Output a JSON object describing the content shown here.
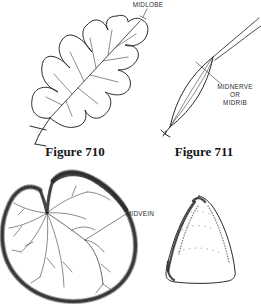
{
  "colors": {
    "ink": "#2b2b2b"
  },
  "figures": {
    "fig710": {
      "caption": "Figure 710",
      "annotation": "MIDLOBE"
    },
    "fig711": {
      "caption": "Figure 711",
      "annotation_lines": [
        "MIDNERVE",
        "OR",
        "MIDRIB"
      ]
    },
    "lower_left": {
      "annotation": "MIDVEIN"
    }
  }
}
